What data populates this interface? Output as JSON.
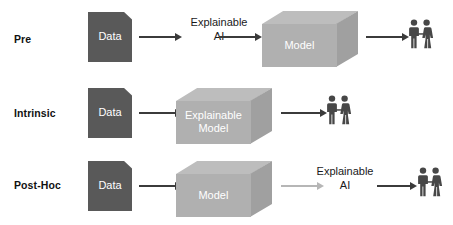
{
  "diagram": {
    "colors": {
      "data_fill": "#595959",
      "cube_top": "#bdbdbd",
      "cube_front": "#b0b0b0",
      "cube_side": "#a0a0a0",
      "arrow_dark": "#3b3b3b",
      "arrow_light": "#b6b6b6",
      "people": "#474747",
      "label_text": "#111111",
      "shape_text": "#ffffff",
      "background": "#ffffff"
    },
    "rows": [
      {
        "label": "Pre",
        "data_label": "Data",
        "text_label": "Explainable\nAI",
        "cube_label": "Model",
        "people_label": "users"
      },
      {
        "label": "Intrinsic",
        "data_label": "Data",
        "cube_label": "Explainable\nModel",
        "people_label": "users"
      },
      {
        "label": "Post-Hoc",
        "data_label": "Data",
        "cube_label": "Model",
        "text_label": "Explainable\nAI",
        "people_label": "users"
      }
    ]
  }
}
